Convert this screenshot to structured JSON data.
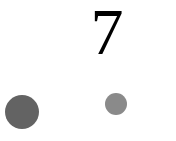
{
  "digit": {
    "text": "7",
    "color": "#000000"
  },
  "dots": [
    {
      "name": "large-dot",
      "cx": 22,
      "cy": 112,
      "r": 17,
      "color": "#636363"
    },
    {
      "name": "small-dot",
      "cx": 116,
      "cy": 104,
      "r": 11,
      "color": "#8a8a8a"
    }
  ]
}
